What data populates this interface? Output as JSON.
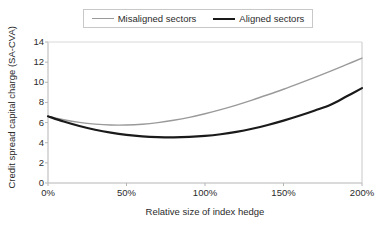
{
  "chart_data": {
    "type": "line",
    "title": "",
    "xlabel": "Relative size of index hedge",
    "ylabel": "Credit spread capital charge (SA-CVA)",
    "xlim": [
      0,
      200
    ],
    "ylim": [
      0,
      14
    ],
    "grid": false,
    "legend_position": "top-center",
    "xticks": [
      "0%",
      "50%",
      "100%",
      "150%",
      "200%"
    ],
    "xtick_values": [
      0,
      50,
      100,
      150,
      200
    ],
    "yticks": [
      "0",
      "2",
      "4",
      "6",
      "8",
      "10",
      "12",
      "14"
    ],
    "ytick_values": [
      0,
      2,
      4,
      6,
      8,
      10,
      12,
      14
    ],
    "x": [
      0,
      10,
      20,
      30,
      40,
      50,
      60,
      70,
      80,
      90,
      100,
      110,
      120,
      130,
      140,
      150,
      160,
      170,
      180,
      190,
      200
    ],
    "series": [
      {
        "name": "Misaligned sectors",
        "color": "#9a9a9a",
        "width": 1.4,
        "values": [
          6.62,
          6.28,
          6.02,
          5.85,
          5.76,
          5.76,
          5.84,
          6.0,
          6.23,
          6.52,
          6.88,
          7.29,
          7.74,
          8.23,
          8.76,
          9.31,
          9.89,
          10.49,
          11.11,
          11.75,
          12.4
        ]
      },
      {
        "name": "Aligned sectors",
        "color": "#1a1a1a",
        "width": 2.2,
        "values": [
          6.62,
          6.1,
          5.66,
          5.29,
          5.0,
          4.78,
          4.63,
          4.55,
          4.53,
          4.57,
          4.67,
          4.84,
          5.08,
          5.39,
          5.76,
          6.19,
          6.67,
          7.2,
          7.77,
          8.58,
          9.42
        ]
      }
    ]
  },
  "legend": {
    "entries": [
      {
        "label": "Misaligned sectors"
      },
      {
        "label": "Aligned sectors"
      }
    ]
  },
  "axes": {
    "x_title": "Relative size of index hedge",
    "y_title": "Credit spread capital charge (SA-CVA)"
  },
  "colors": {
    "misaligned": "#9a9a9a",
    "aligned": "#1a1a1a",
    "axis": "#b5b5b5",
    "text": "#2b2b2b"
  }
}
